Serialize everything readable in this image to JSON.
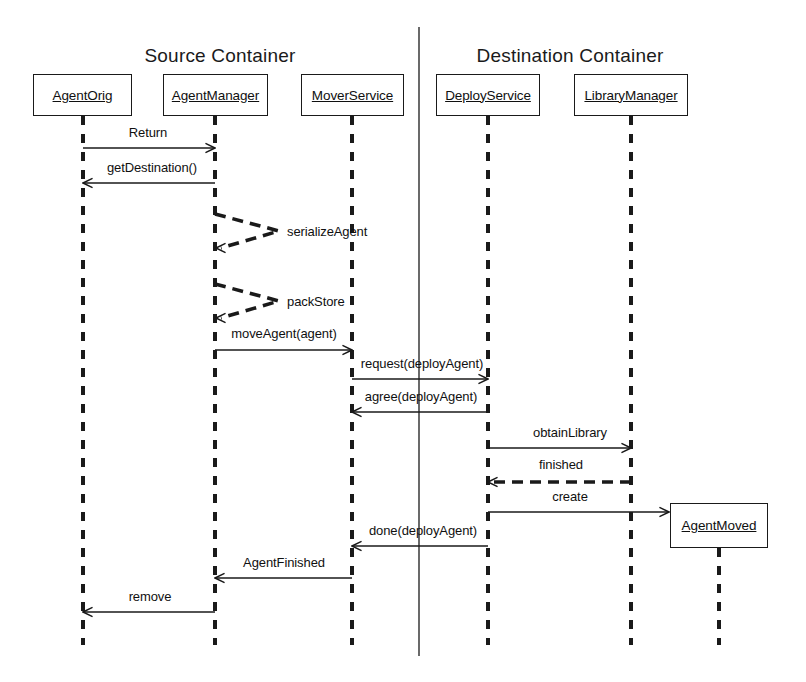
{
  "diagram": {
    "type": "uml-sequence-diagram",
    "colors": {
      "stroke": "#1a1a1a",
      "background": "#ffffff",
      "text": "#101010"
    },
    "partitions": [
      {
        "name": "source",
        "label": "Source Container",
        "center_x": 220,
        "y": 45
      },
      {
        "name": "destination",
        "label": "Destination Container",
        "center_x": 570,
        "y": 45
      }
    ],
    "partition_divider": {
      "x": 419,
      "y1": 27,
      "y2": 656
    },
    "actors": [
      {
        "name": "agent-orig",
        "label": "AgentOrig",
        "x": 33,
        "y": 74,
        "w": 99,
        "h": 42,
        "lifeline_x": 83,
        "lifeline_y2": 645
      },
      {
        "name": "agent-manager",
        "label": "AgentManager",
        "x": 163,
        "y": 74,
        "w": 105,
        "h": 42,
        "lifeline_x": 215,
        "lifeline_y2": 645
      },
      {
        "name": "mover-service",
        "label": "MoverService",
        "x": 301,
        "y": 74,
        "w": 103,
        "h": 42,
        "lifeline_x": 352,
        "lifeline_y2": 645
      },
      {
        "name": "deploy-service",
        "label": "DeployService",
        "x": 436,
        "y": 74,
        "w": 104,
        "h": 42,
        "lifeline_x": 488,
        "lifeline_y2": 645
      },
      {
        "name": "library-manager",
        "label": "LibraryManager",
        "x": 574,
        "y": 74,
        "w": 114,
        "h": 42,
        "lifeline_x": 631,
        "lifeline_y2": 645
      },
      {
        "name": "agent-moved",
        "label": "AgentMoved",
        "x": 670,
        "y": 503,
        "w": 98,
        "h": 45,
        "lifeline_x": 719,
        "lifeline_y2": 645
      }
    ],
    "messages": [
      {
        "name": "return",
        "label": "Return",
        "from": "agent-orig",
        "to": "agent-manager",
        "x1": 83,
        "x2": 215,
        "y": 148,
        "dir": "right",
        "style": "solid",
        "label_x": 148,
        "label_y": 133
      },
      {
        "name": "get-destination",
        "label": "getDestination()",
        "from": "agent-manager",
        "to": "agent-orig",
        "x1": 215,
        "x2": 83,
        "y": 183,
        "dir": "left",
        "style": "solid",
        "label_x": 152,
        "label_y": 168
      },
      {
        "name": "serialize-agent",
        "label": "serializeAgent",
        "from": "agent-manager",
        "to": "agent-manager",
        "x1": 215,
        "x2": 279,
        "y": 214,
        "y2": 248,
        "dir": "self",
        "style": "dashed",
        "label_x": 287,
        "label_y": 232
      },
      {
        "name": "pack-store",
        "label": "packStore",
        "from": "agent-manager",
        "to": "agent-manager",
        "x1": 215,
        "x2": 279,
        "y": 284,
        "y2": 318,
        "dir": "self",
        "style": "dashed",
        "label_x": 287,
        "label_y": 302
      },
      {
        "name": "move-agent",
        "label": "moveAgent(agent)",
        "from": "agent-manager",
        "to": "mover-service",
        "x1": 215,
        "x2": 352,
        "y": 350,
        "dir": "right",
        "style": "solid",
        "label_x": 284,
        "label_y": 334
      },
      {
        "name": "request-deploy",
        "label": "request(deployAgent)",
        "from": "mover-service",
        "to": "deploy-service",
        "x1": 352,
        "x2": 488,
        "y": 379,
        "dir": "right",
        "style": "solid",
        "label_x": 422,
        "label_y": 364
      },
      {
        "name": "agree-deploy",
        "label": "agree(deployAgent)",
        "from": "deploy-service",
        "to": "mover-service",
        "x1": 488,
        "x2": 352,
        "y": 412,
        "dir": "left",
        "style": "solid",
        "label_x": 421,
        "label_y": 397
      },
      {
        "name": "obtain-library",
        "label": "obtainLibrary",
        "from": "deploy-service",
        "to": "library-manager",
        "x1": 488,
        "x2": 631,
        "y": 448,
        "dir": "right",
        "style": "solid",
        "label_x": 570,
        "label_y": 433
      },
      {
        "name": "finished",
        "label": "finished",
        "from": "library-manager",
        "to": "deploy-service",
        "x1": 631,
        "x2": 488,
        "y": 482,
        "dir": "left",
        "style": "dashed",
        "label_x": 561,
        "label_y": 465
      },
      {
        "name": "create",
        "label": "create",
        "from": "deploy-service",
        "to": "agent-moved",
        "x1": 488,
        "x2": 669,
        "y": 512,
        "dir": "right",
        "style": "solid",
        "label_x": 570,
        "label_y": 497
      },
      {
        "name": "done-deploy",
        "label": "done(deployAgent)",
        "from": "deploy-service",
        "to": "mover-service",
        "x1": 488,
        "x2": 352,
        "y": 546,
        "dir": "left",
        "style": "solid",
        "label_x": 423,
        "label_y": 531
      },
      {
        "name": "agent-finished",
        "label": "AgentFinished",
        "from": "mover-service",
        "to": "agent-manager",
        "x1": 352,
        "x2": 215,
        "y": 578,
        "dir": "left",
        "style": "solid",
        "label_x": 284,
        "label_y": 563
      },
      {
        "name": "remove",
        "label": "remove",
        "from": "agent-manager",
        "to": "agent-orig",
        "x1": 215,
        "x2": 83,
        "y": 612,
        "dir": "left",
        "style": "solid",
        "label_x": 150,
        "label_y": 597
      }
    ]
  }
}
